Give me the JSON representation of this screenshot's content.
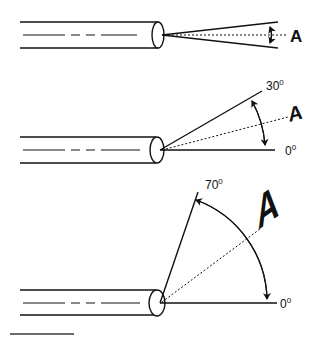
{
  "figure": {
    "panels": [
      {
        "id": "panel-1",
        "target_label": "A",
        "angle_labels": []
      },
      {
        "id": "panel-2",
        "target_label": "A",
        "angle_labels": {
          "start": "0",
          "end": "30",
          "degree_mark": "0"
        }
      },
      {
        "id": "panel-3",
        "target_label": "A",
        "angle_labels": {
          "start": "0",
          "end": "70",
          "degree_mark": "0"
        }
      }
    ],
    "scale_bar": {
      "color": "#6b6b6b"
    }
  },
  "colors": {
    "ink": "#111111",
    "background": "#ffffff",
    "scale_bar": "#6b6b6b"
  }
}
